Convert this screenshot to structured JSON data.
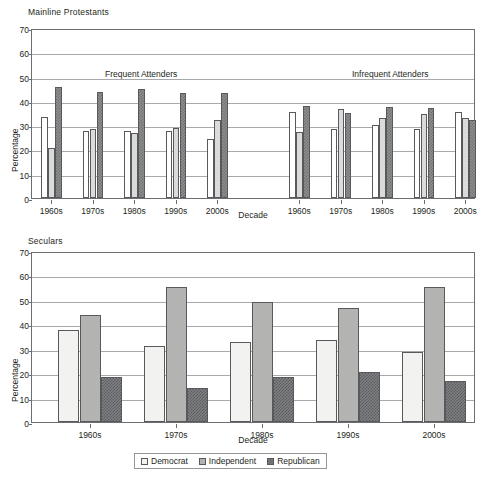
{
  "figure": {
    "ylabel": "Percentage",
    "xlabel": "Decade",
    "yticks": [
      0,
      10,
      20,
      30,
      40,
      50,
      60,
      70
    ],
    "ylim": [
      0,
      70
    ],
    "legend": [
      {
        "key": "democrat",
        "label": "Democrat",
        "swatch": "dotted-light-square"
      },
      {
        "key": "independent",
        "label": "Independent",
        "swatch": "solid-gray-square"
      },
      {
        "key": "republican",
        "label": "Republican",
        "swatch": "checkered-dark-square"
      }
    ]
  },
  "chart_data": [
    {
      "type": "bar",
      "title": "Mainline Protestants",
      "xlabel": "Decade",
      "ylabel": "Percentage",
      "ylim": [
        0,
        70
      ],
      "yticks": [
        0,
        10,
        20,
        30,
        40,
        50,
        60,
        70
      ],
      "grid": true,
      "legend_position": "bottom-shared",
      "panels": [
        {
          "annotation": "Frequent Attenders",
          "categories": [
            "1960s",
            "1970s",
            "1980s",
            "1990s",
            "2000s"
          ],
          "series": [
            {
              "name": "Democrat",
              "values": [
                33.4,
                27.6,
                27.7,
                27.7,
                24.3
              ]
            },
            {
              "name": "Independent",
              "values": [
                20.6,
                28.4,
                26.9,
                28.8,
                32.1
              ]
            },
            {
              "name": "Republican",
              "values": [
                45.8,
                43.8,
                45.0,
                43.4,
                43.3
              ]
            }
          ]
        },
        {
          "annotation": "Infrequent Attenders",
          "categories": [
            "1960s",
            "1970s",
            "1980s",
            "1990s",
            "2000s"
          ],
          "series": [
            {
              "name": "Democrat",
              "values": [
                35.3,
                28.6,
                30.0,
                28.6,
                35.3
              ]
            },
            {
              "name": "Independent",
              "values": [
                27.0,
                36.7,
                33.1,
                34.8,
                32.8
              ]
            },
            {
              "name": "Republican",
              "values": [
                37.7,
                35.0,
                37.3,
                37.0,
                32.3
              ]
            }
          ]
        }
      ]
    },
    {
      "type": "bar",
      "title": "Seculars",
      "xlabel": "Decade",
      "ylabel": "Percentage",
      "ylim": [
        0,
        70
      ],
      "yticks": [
        0,
        10,
        20,
        30,
        40,
        50,
        60,
        70
      ],
      "grid": true,
      "legend_position": "bottom",
      "categories": [
        "1960s",
        "1970s",
        "1980s",
        "1990s",
        "2000s"
      ],
      "series": [
        {
          "name": "Democrat",
          "values": [
            37.8,
            31.2,
            32.9,
            33.6,
            28.7
          ]
        },
        {
          "name": "Independent",
          "values": [
            43.7,
            55.2,
            49.3,
            46.7,
            55.1
          ]
        },
        {
          "name": "Republican",
          "values": [
            18.6,
            13.8,
            18.4,
            20.4,
            16.6
          ]
        }
      ]
    }
  ]
}
